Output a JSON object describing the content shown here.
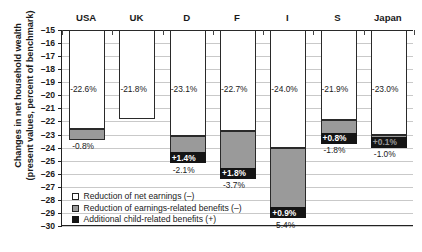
{
  "chart_data": {
    "type": "bar",
    "title": "",
    "xlabel": "",
    "ylabel": "Changes in net household wealth (present values, percent of benchmark)",
    "ylabel_line1": "Changes in net household wealth",
    "ylabel_line2": "(present values, percent of benchmark)",
    "ylim": [
      -30,
      -15
    ],
    "ytick_labels": [
      "–15",
      "–16",
      "–17",
      "–18",
      "–19",
      "–20",
      "–21",
      "–22",
      "–23",
      "–24",
      "–25",
      "–26",
      "–27",
      "–28",
      "–29",
      "–30"
    ],
    "yticks": [
      -15,
      -16,
      -17,
      -18,
      -19,
      -20,
      -21,
      -22,
      -23,
      -24,
      -25,
      -26,
      -27,
      -28,
      -29,
      -30
    ],
    "grid": true,
    "stacked": true,
    "baseline": -15,
    "categories": [
      "USA",
      "UK",
      "D",
      "F",
      "I",
      "S",
      "Japan"
    ],
    "series": [
      {
        "name": "Reduction of net earnings (–)",
        "color": "#ffffff",
        "values": [
          -22.6,
          -21.8,
          -23.1,
          -22.7,
          -24.0,
          -21.9,
          -23.0
        ],
        "labels": [
          "-22.6%",
          "-21.8%",
          "-23.1%",
          "-22.7%",
          "-24.0%",
          "-21.9%",
          "-23.0%"
        ]
      },
      {
        "name": "Reduction of earnings-related benefits (–)",
        "color": "#9a9a9a",
        "values": [
          -0.8,
          0.0,
          -2.1,
          -3.7,
          -5.4,
          -1.8,
          -1.0
        ],
        "labels": [
          "-0.8%",
          "",
          "-2.1%",
          "-3.7%",
          "-5.4%",
          "-1.8%",
          "-1.0%"
        ]
      },
      {
        "name": "Additional child-related benefits (+)",
        "color": "#141414",
        "values": [
          0.0,
          0.0,
          1.4,
          1.8,
          0.9,
          0.8,
          0.1
        ],
        "labels": [
          "",
          "",
          "+1.4%",
          "+1.8%",
          "+0.9%",
          "+0.8%",
          "+0.1%"
        ]
      }
    ],
    "legend_position": "inside-bottom-left",
    "legend": [
      {
        "swatch": "white",
        "label": "Reduction of net earnings (–)"
      },
      {
        "swatch": "grey",
        "label": "Reduction of earnings-related benefits (–)"
      },
      {
        "swatch": "black",
        "label": "Additional child-related benefits (+)"
      }
    ]
  }
}
